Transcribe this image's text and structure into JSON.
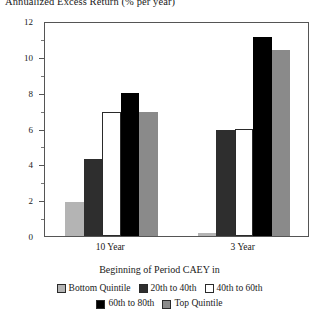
{
  "chart_data": {
    "type": "bar",
    "title": "Annualized Excess Return (% per year)",
    "xlabel": "Beginning of Period CAEY in",
    "ylabel": "",
    "categories": [
      "10 Year",
      "3 Year"
    ],
    "ylim": [
      0,
      12
    ],
    "yticks": [
      0,
      2,
      4,
      6,
      8,
      10,
      12
    ],
    "ytick_labels": [
      "0",
      "2",
      "4",
      "6",
      "8",
      "10",
      "12"
    ],
    "grid": false,
    "legend_position": "bottom",
    "series": [
      {
        "name": "Bottom Quintile",
        "color": "#b4b4b4",
        "values": [
          1.9,
          0.15
        ]
      },
      {
        "name": "20th to 40th",
        "color": "#2e2e2e",
        "values": [
          4.3,
          5.9
        ]
      },
      {
        "name": "40th to 60th",
        "color": "#ffffff",
        "values": [
          6.9,
          6.0
        ]
      },
      {
        "name": "60th to 80th",
        "color": "#000000",
        "values": [
          8.0,
          11.1
        ]
      },
      {
        "name": "Top Quintile",
        "color": "#8a8a8a",
        "values": [
          6.9,
          10.4
        ]
      }
    ]
  },
  "legend": {
    "title": "Beginning of Period CAEY in",
    "row1": [
      {
        "label": "Bottom Quintile",
        "color": "#b4b4b4"
      },
      {
        "label": "20th to 40th",
        "color": "#2e2e2e"
      },
      {
        "label": "40th to 60th",
        "color": "#ffffff"
      }
    ],
    "row2": [
      {
        "label": "60th to 80th",
        "color": "#000000"
      },
      {
        "label": "Top Quintile",
        "color": "#8a8a8a"
      }
    ]
  },
  "axis": {
    "y_labels": [
      "12",
      "10",
      "8",
      "6",
      "4",
      "2",
      "0"
    ],
    "x_labels": [
      "10 Year",
      "3 Year"
    ]
  },
  "colors": {
    "axis": "#555555",
    "text": "#1a1a1a",
    "background": "#ffffff"
  }
}
